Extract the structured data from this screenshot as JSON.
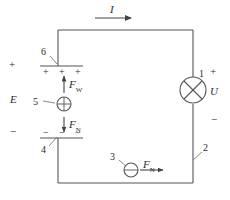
{
  "figure": {
    "type": "circuit-diagram",
    "stroke_color": "#555555",
    "text_color": "#2b2b2b",
    "background": "#ffffff"
  },
  "labels": {
    "current": "I",
    "emf": "E",
    "voltage": "U",
    "plus_top_left": "+",
    "minus_bottom_left": "−",
    "plus_lamp": "+",
    "minus_lamp": "−",
    "force_work": "F",
    "force_work_sub": "W",
    "force_electric": "F",
    "force_electric_sub": "N",
    "force_source": "F",
    "force_source_sub": "N"
  },
  "callouts": [
    {
      "id": "1",
      "target": "lamp",
      "text": "1"
    },
    {
      "id": "2",
      "target": "right-wire",
      "text": "2"
    },
    {
      "id": "3",
      "target": "negative-charge-carrier",
      "text": "3"
    },
    {
      "id": "4",
      "target": "negative-plate",
      "text": "4"
    },
    {
      "id": "5",
      "target": "positive-charge-carrier",
      "text": "5"
    },
    {
      "id": "6",
      "target": "positive-plate",
      "text": "6"
    }
  ],
  "plates": {
    "positive_signs": [
      "+",
      "+",
      "+"
    ],
    "negative_signs": [
      "−",
      "−",
      "−"
    ]
  },
  "charges": {
    "upper_charge_symbol": "+",
    "lower_charge_symbol": "−"
  }
}
